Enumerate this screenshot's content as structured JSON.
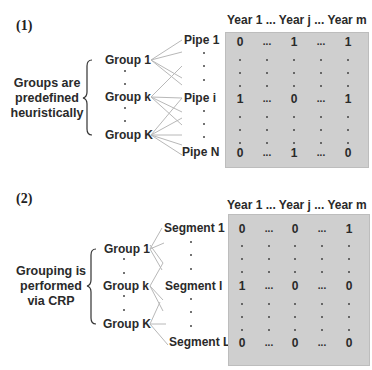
{
  "panel1": {
    "label": "(1)",
    "description": [
      "Groups are",
      "predefined",
      "heuristically"
    ],
    "groups": [
      "Group 1",
      "Group k",
      "Group K"
    ],
    "items": [
      "Pipe 1",
      "Pipe i",
      "Pipe N"
    ],
    "header": [
      "Year 1",
      "...",
      "Year j",
      "...",
      "Year m"
    ],
    "rows": [
      [
        "0",
        "...",
        "1",
        "...",
        "1"
      ],
      [
        "1",
        "...",
        "0",
        "...",
        "1"
      ],
      [
        "0",
        "...",
        "1",
        "...",
        "0"
      ]
    ],
    "table_color": "#cfcfcf"
  },
  "panel2": {
    "label": "(2)",
    "description": [
      "Grouping is",
      "performed",
      "via CRP"
    ],
    "groups": [
      "Group 1",
      "Group k",
      "Group K"
    ],
    "items": [
      "Segment 1",
      "Segment l",
      "Segment L"
    ],
    "header": [
      "Year 1",
      "...",
      "Year j",
      "...",
      "Year m"
    ],
    "rows": [
      [
        "0",
        "...",
        "0",
        "...",
        "1"
      ],
      [
        "1",
        "...",
        "0",
        "...",
        "0"
      ],
      [
        "0",
        "...",
        "0",
        "...",
        "0"
      ]
    ],
    "table_color": "#cfcfcf"
  }
}
